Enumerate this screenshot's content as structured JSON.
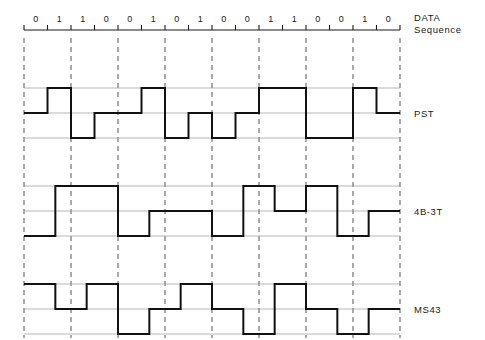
{
  "figure": {
    "width": 485,
    "height": 340,
    "background": "#ffffff",
    "wave_color": "#111111",
    "grid_color": "#9a9a9a",
    "dash_color": "#555555",
    "axis_color": "#1a1a1a"
  },
  "data_sequence": {
    "label_line1": "DATA",
    "label_line2": "Sequence",
    "bits": [
      "0",
      "1",
      "1",
      "0",
      "0",
      "1",
      "0",
      "1",
      "0",
      "0",
      "1",
      "1",
      "0",
      "0",
      "1",
      "0"
    ],
    "bit_count": 16
  },
  "axis": {
    "x_start": 24,
    "x_end": 400,
    "bit_width": 23.5,
    "tick_y": 30,
    "tick_height": 5
  },
  "dashed_columns": [
    24,
    71,
    118,
    165,
    212,
    259,
    306,
    353,
    400
  ],
  "rows": [
    {
      "name": "pst",
      "label": "PST",
      "label_x": 414,
      "label_y": 113,
      "baseline_mid": 113,
      "level_step": 25,
      "grid_levels": [
        88,
        113,
        138
      ],
      "symbol_count": 16,
      "levels": [
        0,
        1,
        -1,
        0,
        0,
        1,
        -1,
        0,
        -1,
        0,
        1,
        1,
        -1,
        -1,
        1,
        0
      ],
      "description": "Paired selected ternary, three levels: high, mid, low"
    },
    {
      "name": "4b3t",
      "label": "4B-3T",
      "label_x": 414,
      "label_y": 211,
      "baseline_mid": 211,
      "level_step": 25,
      "grid_levels": [
        186,
        211,
        236
      ],
      "symbol_count": 12,
      "symbol_width": 31.33,
      "levels": [
        -1,
        1,
        1,
        -1,
        0,
        0,
        -1,
        1,
        0,
        1,
        -1,
        0
      ],
      "description": "4 binary bits mapped to 3 ternary symbols"
    },
    {
      "name": "ms43",
      "label": "MS43",
      "label_x": 414,
      "label_y": 309,
      "baseline_mid": 309,
      "level_step": 25,
      "grid_levels": [
        284,
        309,
        334
      ],
      "symbol_count": 12,
      "symbol_width": 31.33,
      "levels": [
        1,
        0,
        1,
        -1,
        0,
        1,
        0,
        -1,
        1,
        0,
        -1,
        0
      ],
      "description": "MS43 four-binary three-ternary line code"
    }
  ]
}
